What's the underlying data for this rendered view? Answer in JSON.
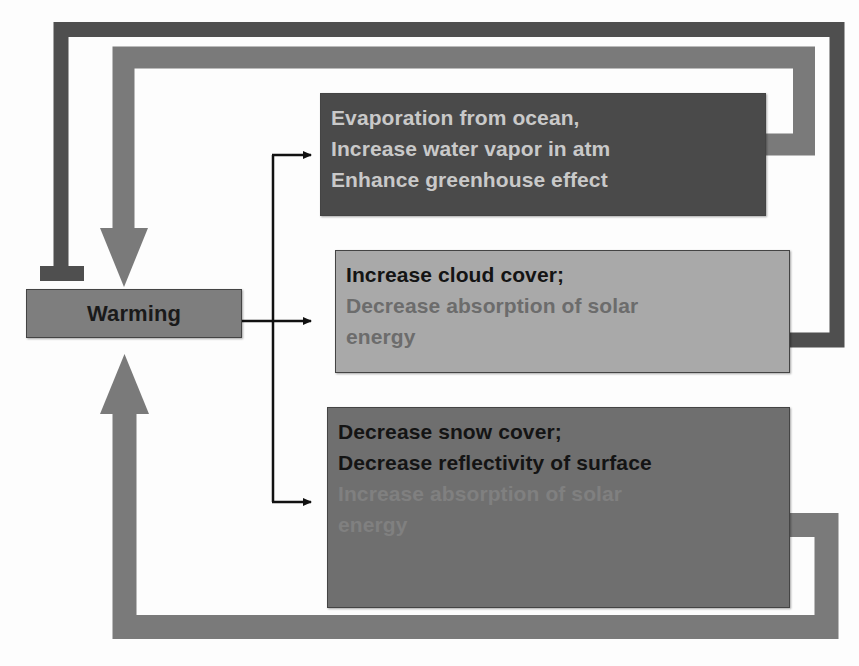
{
  "diagram": {
    "type": "feedback-loop",
    "nodes": {
      "warming": {
        "label": "Warming"
      },
      "evaporation": {
        "lines": [
          "Evaporation from ocean,",
          "Increase water vapor in atm",
          "Enhance greenhouse effect"
        ]
      },
      "cloud": {
        "lines": [
          "Increase cloud cover;",
          "Decrease absorption of solar",
          "energy"
        ]
      },
      "snow": {
        "lines": [
          "Decrease snow cover;",
          "Decrease reflectivity of surface",
          "Increase absorption of solar",
          "energy"
        ]
      }
    },
    "edges": [
      {
        "from": "warming",
        "to": "evaporation",
        "kind": "causes"
      },
      {
        "from": "warming",
        "to": "cloud",
        "kind": "causes"
      },
      {
        "from": "warming",
        "to": "snow",
        "kind": "causes"
      },
      {
        "from": "evaporation",
        "to": "warming",
        "kind": "positive-feedback"
      },
      {
        "from": "cloud",
        "to": "warming",
        "kind": "negative-feedback (inhibits)"
      },
      {
        "from": "snow",
        "to": "warming",
        "kind": "positive-feedback"
      }
    ],
    "colors": {
      "background": "#fdfdfd",
      "warming_box": "#7e7e7e",
      "evaporation_box": "#4a4a4a",
      "cloud_box": "#a9a9a9",
      "snow_box": "#6f6f6f",
      "inhibit_line": "#4f4f4f",
      "feedback_arrow": "#7a7a7a",
      "connector": "#111111"
    }
  }
}
